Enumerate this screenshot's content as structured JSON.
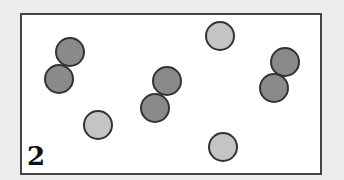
{
  "panel_label": "2",
  "colors": {
    "dark": "#8a8a8a",
    "light": "#c4c4c4",
    "border": "#333333"
  },
  "circles": [
    {
      "x": 70,
      "y": 52,
      "r": 15,
      "shade": "dark"
    },
    {
      "x": 59,
      "y": 79,
      "r": 15,
      "shade": "dark"
    },
    {
      "x": 167,
      "y": 81,
      "r": 15,
      "shade": "dark"
    },
    {
      "x": 155,
      "y": 108,
      "r": 15,
      "shade": "dark"
    },
    {
      "x": 285,
      "y": 62,
      "r": 15,
      "shade": "dark"
    },
    {
      "x": 274,
      "y": 88,
      "r": 15,
      "shade": "dark"
    },
    {
      "x": 98,
      "y": 125,
      "r": 15,
      "shade": "light"
    },
    {
      "x": 220,
      "y": 36,
      "r": 15,
      "shade": "light"
    },
    {
      "x": 223,
      "y": 147,
      "r": 15,
      "shade": "light"
    }
  ]
}
